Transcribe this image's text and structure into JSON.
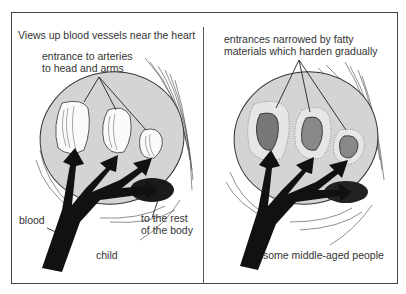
{
  "title": "Views up blood vessels near the heart",
  "panels": [
    {
      "id": "child",
      "caption": "child",
      "labels": {
        "arteries_line1": "entrance to arteries",
        "arteries_line2": "to head and arms",
        "blood": "blood",
        "rest_line1": "to the rest",
        "rest_line2": "of the body"
      }
    },
    {
      "id": "middle-aged",
      "caption": "some middle-aged people",
      "labels": {
        "narrowed_line1": "entrances narrowed by fatty",
        "narrowed_line2": "materials which harden gradually"
      }
    }
  ],
  "colors": {
    "vessel_fill": "#d4d4d4",
    "arrow": "#111111",
    "border": "#444444",
    "text": "#333333"
  }
}
